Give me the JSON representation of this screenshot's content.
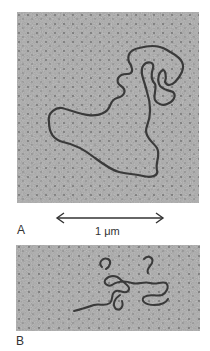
{
  "figure": {
    "panels": [
      {
        "id": "A",
        "label": "A",
        "content": "electron micrograph of extended circular DNA molecule"
      },
      {
        "id": "B",
        "label": "B",
        "content": "electron micrograph of compact/supercoiled DNA molecule"
      }
    ],
    "scale_bar": {
      "label": "1 μm",
      "icon": "double-headed-arrow"
    },
    "colors": {
      "background": "#ffffff",
      "micrograph_gray": "#a8a8a8",
      "dna_strand": "#3a3a3a",
      "text": "#333333"
    }
  }
}
